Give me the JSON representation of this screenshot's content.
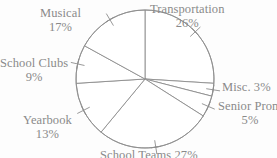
{
  "chart_data": {
    "type": "pie",
    "title": "",
    "subtitle": "",
    "xlabel": "",
    "ylabel": "",
    "legend_position": "none",
    "grid": false,
    "labels_outside": true,
    "start_angle_deg": 0,
    "direction": "clockwise",
    "unit": "%",
    "total": 100,
    "categories": [
      "Transportation",
      "Misc.",
      "Senior Prom",
      "School Teams",
      "Yearbook",
      "School Clubs",
      "Musical"
    ],
    "values": [
      26,
      3,
      5,
      27,
      13,
      9,
      17
    ],
    "slices": [
      {
        "name": "Transportation",
        "value": 26,
        "label": "Transportation",
        "pct_text": "26%",
        "start_deg": 0,
        "end_deg": 93.6
      },
      {
        "name": "Misc.",
        "value": 3,
        "label": "Misc. 3%",
        "pct_text": "3%",
        "start_deg": 93.6,
        "end_deg": 104.4
      },
      {
        "name": "Senior Prom",
        "value": 5,
        "label": "Senior Prom",
        "pct_text": "5%",
        "start_deg": 104.4,
        "end_deg": 122.4
      },
      {
        "name": "School Teams",
        "value": 27,
        "label": "School Teams",
        "pct_text": "27%",
        "start_deg": 122.4,
        "end_deg": 219.6
      },
      {
        "name": "Yearbook",
        "value": 13,
        "label": "Yearbook",
        "pct_text": "13%",
        "start_deg": 219.6,
        "end_deg": 266.4
      },
      {
        "name": "School Clubs",
        "value": 9,
        "label": "School Clubs",
        "pct_text": "9%",
        "start_deg": 266.4,
        "end_deg": 298.8
      },
      {
        "name": "Musical",
        "value": 17,
        "label": "Musical",
        "pct_text": "17%",
        "start_deg": 298.8,
        "end_deg": 360
      }
    ],
    "colors": {
      "slice_fill": "#ffffff",
      "slice_stroke": "#8d8d8d",
      "label_text": "#8a8a8a",
      "background": "#fdfdfd"
    },
    "geometry": {
      "center_x": 145,
      "center_y": 79,
      "radius": 69
    }
  },
  "labels": {
    "transportation": {
      "name": "Transportation",
      "pct": "26%"
    },
    "misc": {
      "name": "Misc. 3%",
      "pct": ""
    },
    "senior_prom": {
      "name": "Senior Prom",
      "pct": "5%"
    },
    "school_teams": {
      "name": "School Teams",
      "pct": "27%"
    },
    "yearbook": {
      "name": "Yearbook",
      "pct": "13%"
    },
    "school_clubs": {
      "name": "School Clubs",
      "pct": "9%"
    },
    "musical": {
      "name": "Musical",
      "pct": "17%"
    }
  }
}
